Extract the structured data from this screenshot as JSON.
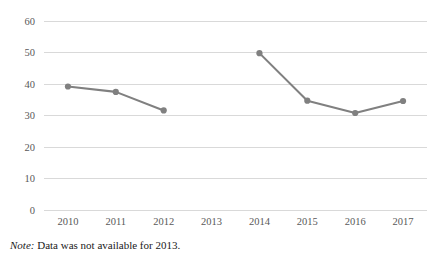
{
  "note": {
    "label": "Note:",
    "text": " Data was not available for 2013."
  },
  "colors": {
    "series_line": "#808080",
    "marker": "#808080",
    "gridline": "#d9d9d9",
    "tick_text": "#595959",
    "note_text": "#1a1a1a",
    "background": "#ffffff"
  },
  "chart_data": {
    "type": "line",
    "title": "",
    "xlabel": "",
    "ylabel": "",
    "categories": [
      "2010",
      "2011",
      "2012",
      "2013",
      "2014",
      "2015",
      "2016",
      "2017"
    ],
    "values": [
      39.2,
      37.5,
      31.6,
      null,
      49.8,
      34.7,
      30.8,
      34.6
    ],
    "series": [
      {
        "name": "",
        "values": [
          39.2,
          37.5,
          31.6,
          null,
          49.8,
          34.7,
          30.8,
          34.6
        ]
      }
    ],
    "ylim": [
      0,
      60
    ],
    "ytick_labels": [
      "0",
      "10",
      "20",
      "30",
      "40",
      "50",
      "60"
    ],
    "ytick_values": [
      0,
      10,
      20,
      30,
      40,
      50,
      60
    ],
    "xtick_labels": [
      "2010",
      "2011",
      "2012",
      "2013",
      "2014",
      "2015",
      "2016",
      "2017"
    ],
    "grid": true,
    "grid_axis": "y",
    "legend": false,
    "markers": true,
    "missing_points": [
      "2013"
    ]
  }
}
